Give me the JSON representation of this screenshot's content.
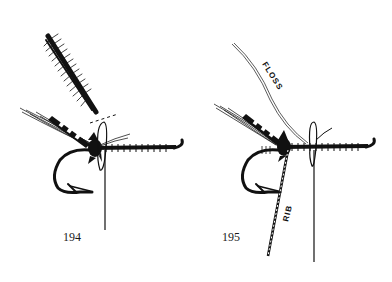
{
  "figures": [
    {
      "number": "194",
      "description": "Fly tying step: hackle feather tied in at head, tinsel/thread hanging from hook shank"
    },
    {
      "number": "195",
      "description": "Fly tying step: floss and rib tied in along hook shank",
      "labels": {
        "floss": "FLOSS",
        "rib": "RIB"
      }
    }
  ],
  "colors": {
    "ink": "#111111",
    "background": "#ffffff"
  }
}
